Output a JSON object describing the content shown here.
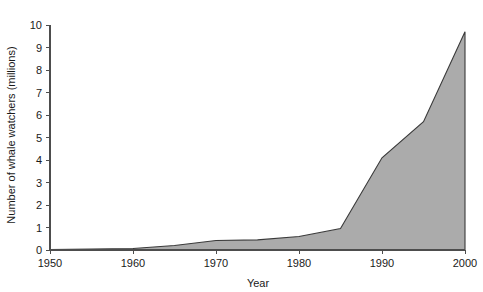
{
  "chart_data": {
    "type": "area",
    "title": "",
    "xlabel": "Year",
    "ylabel": "Number of whale watchers (millions)",
    "xlim": [
      1950,
      2000
    ],
    "ylim": [
      0,
      10
    ],
    "xticks": [
      1950,
      1960,
      1970,
      1980,
      1990,
      2000
    ],
    "xtick_labels": [
      "1950",
      "1960",
      "1970",
      "1980",
      "1990",
      "2000"
    ],
    "yticks": [
      0,
      1,
      2,
      3,
      4,
      5,
      6,
      7,
      8,
      9,
      10
    ],
    "ytick_labels": [
      "0",
      "1",
      "2",
      "3",
      "4",
      "5",
      "6",
      "7",
      "8",
      "9",
      "10"
    ],
    "grid": false,
    "legend": null,
    "fill_color": "#ababab",
    "line_color": "#3a3a3a",
    "x": [
      1950,
      1955,
      1960,
      1965,
      1970,
      1975,
      1980,
      1985,
      1990,
      1995,
      2000
    ],
    "values": [
      0.02,
      0.04,
      0.07,
      0.2,
      0.42,
      0.45,
      0.6,
      0.95,
      4.1,
      5.7,
      9.7
    ],
    "series": [
      {
        "name": "Whale watchers",
        "x": [
          1950,
          1955,
          1960,
          1965,
          1970,
          1975,
          1980,
          1985,
          1990,
          1995,
          2000
        ],
        "values": [
          0.02,
          0.04,
          0.07,
          0.2,
          0.42,
          0.45,
          0.6,
          0.95,
          4.1,
          5.7,
          9.7
        ]
      }
    ]
  },
  "axis": {
    "x_title": "Year",
    "y_title": "Number of whale watchers (millions)"
  }
}
